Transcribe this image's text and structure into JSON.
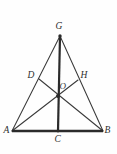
{
  "figure": {
    "kind": "plane-geometry-diagram",
    "background_color": "#fefefe",
    "line_color": "#3a3a3a",
    "heavy_line_color": "#2b2b2b",
    "label_color": "#2e2e2e",
    "canvas": {
      "width": 117,
      "height": 154
    },
    "points": [
      {
        "id": "G",
        "label": "G",
        "x": 60,
        "y": 36,
        "label_x": 55.5,
        "label_y": 21.5,
        "role": "apex-vertex"
      },
      {
        "id": "A",
        "label": "A",
        "x": 12,
        "y": 131,
        "label_x": 3.5,
        "label_y": 125.5,
        "role": "base-left-vertex"
      },
      {
        "id": "B",
        "label": "B",
        "x": 103,
        "y": 131,
        "label_x": 104.5,
        "label_y": 125.5,
        "role": "base-right-vertex"
      },
      {
        "id": "C",
        "label": "C",
        "x": 58,
        "y": 131,
        "label_x": 54.5,
        "label_y": 134.5,
        "role": "base-midpoint"
      },
      {
        "id": "D",
        "label": "D",
        "x": 39,
        "y": 79,
        "label_x": 27.5,
        "label_y": 70.5,
        "role": "point-on-side-AG"
      },
      {
        "id": "H",
        "label": "H",
        "x": 78,
        "y": 80,
        "label_x": 80.5,
        "label_y": 70.5,
        "role": "point-on-side-GB"
      },
      {
        "id": "O",
        "label": "O",
        "x": 58,
        "y": 96,
        "label_x": 59.5,
        "label_y": 81.5,
        "role": "intersection-point"
      }
    ],
    "segments": [
      {
        "id": "AG",
        "from": "A",
        "to": "G",
        "weight": "thin",
        "desc": "left side of triangle through D"
      },
      {
        "id": "GB",
        "from": "G",
        "to": "B",
        "weight": "thin",
        "desc": "right side of triangle through H"
      },
      {
        "id": "AB",
        "from": "A",
        "to": "B",
        "weight": "base",
        "desc": "base of triangle through C"
      },
      {
        "id": "GC",
        "from": "G",
        "to": "C",
        "weight": "thick",
        "desc": "vertical median from apex to base midpoint"
      },
      {
        "id": "AH",
        "from": "A",
        "to": "H",
        "weight": "thin",
        "desc": "cevian from A to H"
      },
      {
        "id": "BD",
        "from": "B",
        "to": "D",
        "weight": "thin",
        "desc": "cevian from B to D"
      }
    ],
    "vertex_dots": [
      "G",
      "O",
      "C"
    ]
  }
}
